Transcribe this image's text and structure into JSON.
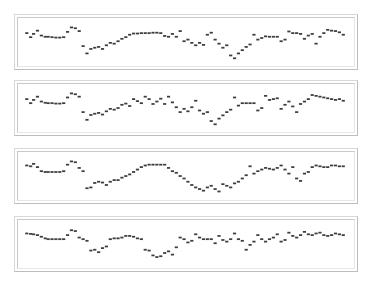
{
  "figure": {
    "background_color": "#ffffff",
    "panel_border_color": "#c9c9c9",
    "panel_fill_color": "#ffffff",
    "marker_color": "#3d3d3d",
    "panel_count": 4
  },
  "chart_data": [
    {
      "type": "scatter",
      "panel_index": 1,
      "title": "",
      "xlabel": "",
      "ylabel": "",
      "xlim": [
        0,
        340
      ],
      "ylim": [
        0,
        1
      ],
      "grid": false,
      "legend": "none",
      "marker": "small-horizontal-dash",
      "marker_color": "#3d3d3d",
      "x": [
        6,
        10,
        13,
        17,
        21,
        25,
        28,
        32,
        36,
        40,
        44,
        48,
        52,
        56,
        60,
        64,
        68,
        72,
        76,
        80,
        84,
        88,
        92,
        96,
        100,
        104,
        108,
        112,
        116,
        120,
        124,
        128,
        132,
        136,
        140,
        144,
        148,
        152,
        156,
        160,
        164,
        168,
        172,
        176,
        180,
        184,
        188,
        192,
        196,
        200,
        204,
        208,
        212,
        216,
        220,
        224,
        228,
        232,
        236,
        240,
        244,
        248,
        252,
        256,
        260,
        264,
        268,
        272,
        276,
        280,
        284,
        288,
        292,
        296,
        300,
        304,
        308,
        312,
        316,
        320,
        324,
        328,
        332
      ],
      "y": [
        0.72,
        0.62,
        0.7,
        0.78,
        0.66,
        0.63,
        0.63,
        0.62,
        0.61,
        0.61,
        0.62,
        0.75,
        0.86,
        0.84,
        0.77,
        0.4,
        0.22,
        0.33,
        0.36,
        0.38,
        0.33,
        0.42,
        0.48,
        0.46,
        0.52,
        0.58,
        0.62,
        0.68,
        0.71,
        0.71,
        0.72,
        0.72,
        0.72,
        0.73,
        0.73,
        0.72,
        0.65,
        0.63,
        0.7,
        0.63,
        0.77,
        0.52,
        0.56,
        0.48,
        0.42,
        0.48,
        0.43,
        0.68,
        0.73,
        0.56,
        0.46,
        0.36,
        0.42,
        0.17,
        0.1,
        0.22,
        0.3,
        0.38,
        0.44,
        0.68,
        0.56,
        0.6,
        0.64,
        0.63,
        0.63,
        0.63,
        0.52,
        0.56,
        0.76,
        0.72,
        0.72,
        0.7,
        0.58,
        0.66,
        0.7,
        0.46,
        0.63,
        0.72,
        0.8,
        0.78,
        0.77,
        0.74,
        0.68
      ]
    },
    {
      "type": "scatter",
      "panel_index": 2,
      "title": "",
      "xlabel": "",
      "ylabel": "",
      "xlim": [
        0,
        340
      ],
      "ylim": [
        0,
        1
      ],
      "grid": false,
      "legend": "none",
      "marker": "small-horizontal-dash",
      "marker_color": "#3d3d3d",
      "x": [
        6,
        10,
        13,
        17,
        21,
        25,
        28,
        32,
        36,
        40,
        44,
        48,
        52,
        56,
        60,
        64,
        68,
        72,
        76,
        80,
        84,
        88,
        92,
        96,
        100,
        104,
        108,
        112,
        116,
        120,
        124,
        128,
        132,
        136,
        140,
        144,
        148,
        152,
        156,
        160,
        164,
        168,
        172,
        176,
        180,
        184,
        188,
        192,
        196,
        200,
        204,
        208,
        212,
        216,
        220,
        224,
        228,
        232,
        236,
        240,
        244,
        248,
        252,
        256,
        260,
        264,
        268,
        272,
        276,
        280,
        284,
        288,
        292,
        296,
        300,
        304,
        308,
        312,
        316,
        320,
        324,
        328,
        332
      ],
      "y": [
        0.72,
        0.62,
        0.7,
        0.78,
        0.66,
        0.63,
        0.62,
        0.62,
        0.61,
        0.61,
        0.62,
        0.76,
        0.86,
        0.84,
        0.78,
        0.4,
        0.21,
        0.33,
        0.36,
        0.38,
        0.34,
        0.42,
        0.48,
        0.46,
        0.5,
        0.58,
        0.61,
        0.55,
        0.72,
        0.67,
        0.62,
        0.78,
        0.72,
        0.6,
        0.66,
        0.73,
        0.6,
        0.78,
        0.64,
        0.52,
        0.4,
        0.48,
        0.42,
        0.52,
        0.68,
        0.44,
        0.36,
        0.4,
        0.18,
        0.1,
        0.24,
        0.32,
        0.4,
        0.46,
        0.76,
        0.56,
        0.62,
        0.62,
        0.62,
        0.62,
        0.44,
        0.5,
        0.8,
        0.7,
        0.72,
        0.74,
        0.48,
        0.58,
        0.66,
        0.54,
        0.4,
        0.6,
        0.66,
        0.72,
        0.82,
        0.8,
        0.78,
        0.76,
        0.74,
        0.72,
        0.7,
        0.72,
        0.68
      ]
    },
    {
      "type": "scatter",
      "panel_index": 3,
      "title": "",
      "xlabel": "",
      "ylabel": "",
      "xlim": [
        0,
        340
      ],
      "ylim": [
        0,
        1
      ],
      "grid": false,
      "legend": "none",
      "marker": "small-horizontal-dash",
      "marker_color": "#3d3d3d",
      "x": [
        6,
        10,
        13,
        17,
        21,
        25,
        28,
        32,
        36,
        40,
        44,
        48,
        52,
        56,
        60,
        64,
        68,
        72,
        76,
        80,
        84,
        88,
        92,
        96,
        100,
        104,
        108,
        112,
        116,
        120,
        124,
        128,
        132,
        136,
        140,
        144,
        148,
        152,
        156,
        160,
        164,
        168,
        172,
        176,
        180,
        184,
        188,
        192,
        196,
        200,
        204,
        208,
        212,
        216,
        220,
        224,
        228,
        232,
        236,
        240,
        244,
        248,
        252,
        256,
        260,
        264,
        268,
        272,
        276,
        280,
        284,
        288,
        292,
        296,
        300,
        304,
        308,
        312,
        316,
        320,
        324,
        328,
        332
      ],
      "y": [
        0.76,
        0.74,
        0.8,
        0.72,
        0.62,
        0.6,
        0.6,
        0.6,
        0.6,
        0.6,
        0.62,
        0.78,
        0.86,
        0.84,
        0.7,
        0.62,
        0.2,
        0.22,
        0.33,
        0.36,
        0.34,
        0.28,
        0.36,
        0.4,
        0.4,
        0.46,
        0.5,
        0.54,
        0.6,
        0.66,
        0.72,
        0.76,
        0.78,
        0.78,
        0.78,
        0.78,
        0.78,
        0.7,
        0.62,
        0.58,
        0.5,
        0.44,
        0.36,
        0.28,
        0.22,
        0.18,
        0.14,
        0.22,
        0.26,
        0.18,
        0.12,
        0.3,
        0.26,
        0.22,
        0.32,
        0.36,
        0.44,
        0.52,
        0.74,
        0.56,
        0.62,
        0.66,
        0.7,
        0.68,
        0.66,
        0.7,
        0.76,
        0.66,
        0.56,
        0.72,
        0.44,
        0.38,
        0.56,
        0.6,
        0.72,
        0.76,
        0.74,
        0.72,
        0.72,
        0.76,
        0.76,
        0.74,
        0.74
      ]
    },
    {
      "type": "scatter",
      "panel_index": 4,
      "title": "",
      "xlabel": "",
      "ylabel": "",
      "xlim": [
        0,
        340
      ],
      "ylim": [
        0,
        1
      ],
      "grid": false,
      "legend": "none",
      "marker": "small-horizontal-dash",
      "marker_color": "#3d3d3d",
      "x": [
        6,
        10,
        13,
        17,
        21,
        25,
        28,
        32,
        36,
        40,
        44,
        48,
        52,
        56,
        60,
        64,
        68,
        72,
        76,
        80,
        84,
        88,
        92,
        96,
        100,
        104,
        108,
        112,
        116,
        120,
        124,
        128,
        132,
        136,
        140,
        144,
        148,
        152,
        156,
        160,
        164,
        168,
        172,
        176,
        180,
        184,
        188,
        192,
        196,
        200,
        204,
        208,
        212,
        216,
        220,
        224,
        228,
        232,
        236,
        240,
        244,
        248,
        252,
        256,
        260,
        264,
        268,
        272,
        276,
        280,
        284,
        288,
        292,
        296,
        300,
        304,
        308,
        312,
        316,
        320,
        324,
        328,
        332
      ],
      "y": [
        0.76,
        0.75,
        0.74,
        0.72,
        0.68,
        0.64,
        0.62,
        0.62,
        0.62,
        0.62,
        0.62,
        0.72,
        0.84,
        0.82,
        0.66,
        0.62,
        0.58,
        0.34,
        0.36,
        0.3,
        0.4,
        0.44,
        0.62,
        0.64,
        0.64,
        0.66,
        0.7,
        0.7,
        0.68,
        0.64,
        0.62,
        0.36,
        0.34,
        0.22,
        0.18,
        0.2,
        0.28,
        0.32,
        0.24,
        0.42,
        0.66,
        0.62,
        0.54,
        0.58,
        0.74,
        0.66,
        0.62,
        0.62,
        0.62,
        0.52,
        0.7,
        0.6,
        0.56,
        0.62,
        0.76,
        0.62,
        0.58,
        0.36,
        0.48,
        0.56,
        0.72,
        0.62,
        0.56,
        0.62,
        0.66,
        0.74,
        0.56,
        0.6,
        0.78,
        0.7,
        0.66,
        0.72,
        0.8,
        0.74,
        0.72,
        0.76,
        0.78,
        0.72,
        0.7,
        0.72,
        0.76,
        0.74,
        0.72
      ]
    }
  ],
  "panels": [
    {
      "name": "panel-1",
      "x": 14,
      "y": 14,
      "width": 344,
      "height": 56
    },
    {
      "name": "panel-2",
      "x": 14,
      "y": 80,
      "width": 344,
      "height": 56
    },
    {
      "name": "panel-3",
      "x": 14,
      "y": 148,
      "width": 344,
      "height": 56
    },
    {
      "name": "panel-4",
      "x": 14,
      "y": 216,
      "width": 344,
      "height": 56
    }
  ]
}
